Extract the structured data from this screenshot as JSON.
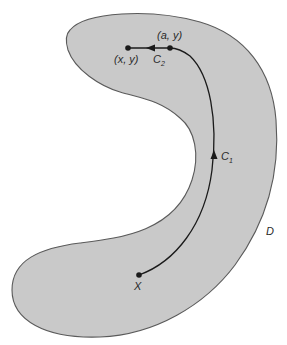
{
  "diagram": {
    "region": {
      "label": "D",
      "fill": "#c8c8c8",
      "stroke": "#555555"
    },
    "points": {
      "start": {
        "label": "X"
      },
      "corner": {
        "label": "(a, y)"
      },
      "end": {
        "label": "(x, y)"
      }
    },
    "curves": {
      "c1": {
        "label": "C",
        "subscript": "1"
      },
      "c2": {
        "label": "C",
        "subscript": "2"
      }
    },
    "path_color": "#1a1a1a"
  }
}
